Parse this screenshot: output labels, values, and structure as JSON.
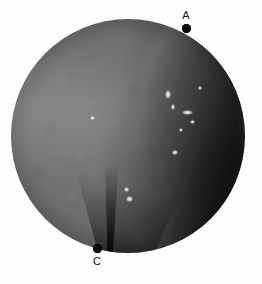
{
  "figure": {
    "kind": "endoscopic-photograph",
    "modality": "white-light endoscopy",
    "color_mode": "grayscale",
    "field_of_view_shape": "circle",
    "canvas": {
      "width": 262,
      "height": 284,
      "background": "#fefefe"
    },
    "scope_field": {
      "center_x": 128,
      "center_y": 136,
      "radius": 117,
      "base_color": "#6e6e6e",
      "dark_rim_color": "#242424",
      "bright_tissue_color": "#9a9a9a"
    }
  },
  "annotations": {
    "marker_color": "#0a0a0a",
    "label_color": "#111111",
    "points": [
      {
        "id": "A",
        "label": "A",
        "x": 186,
        "y": 28,
        "label_position": "above",
        "description": "landmark on upper-right rim of the endoscopic field"
      },
      {
        "id": "C",
        "label": "C",
        "x": 97,
        "y": 248,
        "label_position": "below",
        "description": "landmark at the base of the dark mucosal cleft at the inferior field margin"
      }
    ]
  },
  "scene_features": {
    "mucosal_fold": {
      "name": "longitudinal mucosal fold",
      "location": "right half of field, running superior to inferior"
    },
    "cleft": {
      "name": "dark converging cleft",
      "location": "inferior mid-field, apex at landmark C"
    },
    "specular_highlights": [
      {
        "x": 168,
        "y": 94,
        "w": 6,
        "h": 9
      },
      {
        "x": 173,
        "y": 107,
        "w": 4,
        "h": 6
      },
      {
        "x": 187,
        "y": 112,
        "w": 11,
        "h": 5
      },
      {
        "x": 192,
        "y": 122,
        "w": 5,
        "h": 4
      },
      {
        "x": 181,
        "y": 130,
        "w": 4,
        "h": 4
      },
      {
        "x": 175,
        "y": 152,
        "w": 6,
        "h": 5
      },
      {
        "x": 126,
        "y": 189,
        "w": 5,
        "h": 5
      },
      {
        "x": 129,
        "y": 199,
        "w": 7,
        "h": 6
      },
      {
        "x": 200,
        "y": 88,
        "w": 4,
        "h": 4
      },
      {
        "x": 92,
        "y": 118,
        "w": 5,
        "h": 4
      }
    ]
  }
}
